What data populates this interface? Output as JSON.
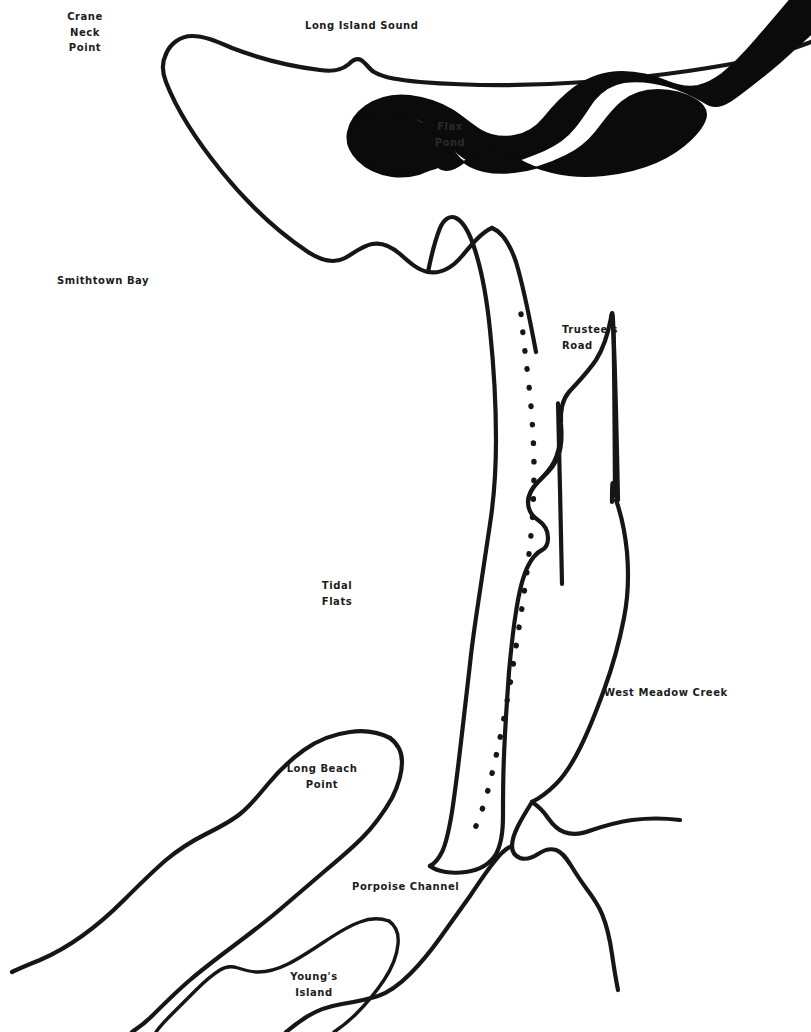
{
  "map": {
    "title": "West Meadow Creek and Flax Pond area map",
    "background_color": "#ffffff",
    "ink_color": "#161616",
    "water_fill_color": "#0b0b0b",
    "width": 811,
    "height": 1032,
    "labels": [
      {
        "id": "crane-neck-point",
        "text": "Crane\nNeck\nPoint",
        "x": 84,
        "y": 9,
        "align": "center"
      },
      {
        "id": "long-island-sound",
        "text": "Long Island Sound",
        "x": 305,
        "y": 18,
        "align": "left"
      },
      {
        "id": "flax-pond",
        "text": "Flax\nPond",
        "x": 448,
        "y": 119,
        "align": "center"
      },
      {
        "id": "smithtown-bay",
        "text": "Smithtown Bay",
        "x": 57,
        "y": 273,
        "align": "left"
      },
      {
        "id": "trustees-road",
        "text": "Trustee's\nRoad",
        "x": 562,
        "y": 322,
        "align": "left"
      },
      {
        "id": "tidal-flats",
        "text": "Tidal\nFlats",
        "x": 335,
        "y": 578,
        "align": "center"
      },
      {
        "id": "west-meadow-creek",
        "text": "West Meadow Creek",
        "x": 604,
        "y": 685,
        "align": "left"
      },
      {
        "id": "long-beach-point",
        "text": "Long Beach\nPoint",
        "x": 290,
        "y": 761,
        "align": "center"
      },
      {
        "id": "porpoise-channel",
        "text": "Porpoise Channel",
        "x": 352,
        "y": 879,
        "align": "left"
      },
      {
        "id": "youngs-island",
        "text": "Young's\nIsland",
        "x": 302,
        "y": 969,
        "align": "center"
      }
    ],
    "features": [
      {
        "id": "crane-neck-peninsula",
        "type": "coastline",
        "label": "Crane Neck / Old Field peninsula shoreline"
      },
      {
        "id": "flax-pond-water",
        "type": "water-body",
        "label": "Flax Pond filled water body"
      },
      {
        "id": "sound-shoreline-east",
        "type": "coastline",
        "label": "Long Island Sound shoreline east of Flax Pond"
      },
      {
        "id": "tidal-flats-spit",
        "type": "coastline",
        "label": "Tidal flats spit west shore"
      },
      {
        "id": "trustees-road-track",
        "type": "road",
        "label": "Trustee's Road dotted track"
      },
      {
        "id": "west-meadow-creek-channel",
        "type": "channel",
        "label": "West Meadow Creek channel"
      },
      {
        "id": "creek-branches",
        "type": "channel",
        "label": "Lower creek branches"
      },
      {
        "id": "long-beach-spit",
        "type": "coastline",
        "label": "Long Beach Point spit"
      },
      {
        "id": "youngs-island-shore",
        "type": "coastline",
        "label": "Young's Island shoreline"
      }
    ]
  }
}
